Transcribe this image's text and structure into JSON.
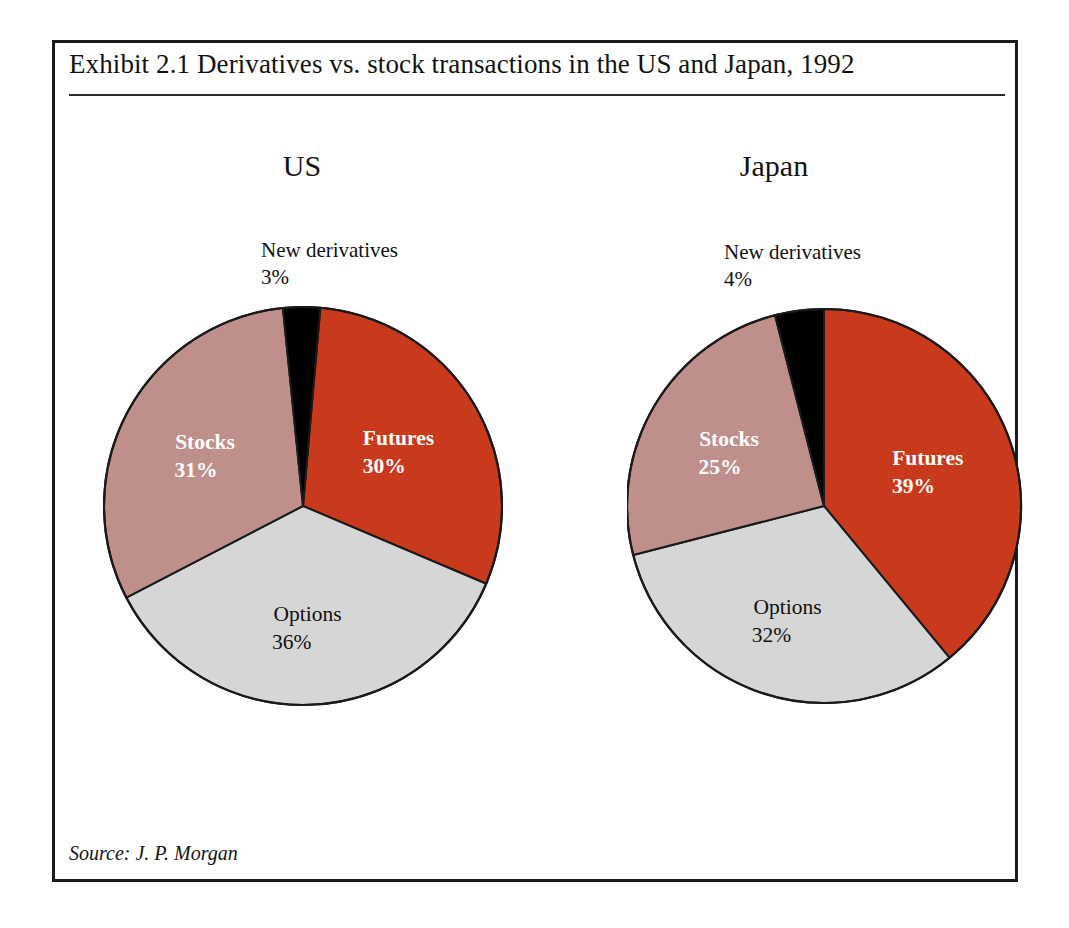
{
  "exhibit": {
    "title": "Exhibit 2.1  Derivatives vs. stock transactions in the US and Japan, 1992",
    "source_note": "Source: J. P. Morgan"
  },
  "colors": {
    "futures": "#C9391C",
    "options": "#D6D6D6",
    "stocks": "#BE8F8B",
    "new_derivatives": "#000000",
    "outline": "#1a1a1a",
    "frame": "#1a1a1a",
    "text": "#121212"
  },
  "chart_data": [
    {
      "type": "pie",
      "title": "US",
      "categories": [
        "Futures",
        "Options",
        "Stocks",
        "New derivatives"
      ],
      "values": [
        30,
        36,
        31,
        3
      ],
      "unit": "%",
      "start_angle_deg": 5,
      "direction": "clockwise",
      "legend": "none",
      "slices": [
        {
          "label": "Futures",
          "value": 30,
          "value_text": "30%",
          "color": "#C9391C",
          "text_color": "light",
          "label_placement": "inside"
        },
        {
          "label": "Options",
          "value": 36,
          "value_text": "36%",
          "color": "#D6D6D6",
          "text_color": "dark",
          "label_placement": "inside"
        },
        {
          "label": "Stocks",
          "value": 31,
          "value_text": "31%",
          "color": "#BE8F8B",
          "text_color": "light",
          "label_placement": "inside"
        },
        {
          "label": "New derivatives",
          "value": 3,
          "value_text": "3%",
          "color": "#000000",
          "text_color": "dark",
          "label_placement": "callout-above"
        }
      ],
      "callout": {
        "label": "New derivatives",
        "value_text": "3%"
      }
    },
    {
      "type": "pie",
      "title": "Japan",
      "categories": [
        "Futures",
        "Options",
        "Stocks",
        "New derivatives"
      ],
      "values": [
        39,
        32,
        25,
        4
      ],
      "unit": "%",
      "start_angle_deg": 0,
      "direction": "clockwise",
      "legend": "none",
      "slices": [
        {
          "label": "Futures",
          "value": 39,
          "value_text": "39%",
          "color": "#C9391C",
          "text_color": "light",
          "label_placement": "inside"
        },
        {
          "label": "Options",
          "value": 32,
          "value_text": "32%",
          "color": "#D6D6D6",
          "text_color": "dark",
          "label_placement": "inside"
        },
        {
          "label": "Stocks",
          "value": 25,
          "value_text": "25%",
          "color": "#BE8F8B",
          "text_color": "light",
          "label_placement": "inside"
        },
        {
          "label": "New derivatives",
          "value": 4,
          "value_text": "4%",
          "color": "#000000",
          "text_color": "dark",
          "label_placement": "callout-above"
        }
      ],
      "callout": {
        "label": "New derivatives",
        "value_text": "4%"
      }
    }
  ],
  "geometry": {
    "us": {
      "cx": 200,
      "cy": 200,
      "r": 199
    },
    "japan": {
      "cx": 197,
      "cy": 200,
      "r": 197
    },
    "label_radius_factor": 0.56
  }
}
